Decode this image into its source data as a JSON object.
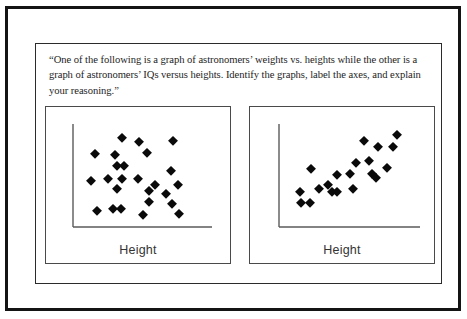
{
  "slide": {
    "background_color": "#ffffff",
    "frame_color": "#141414",
    "panel_border_color": "#2b2b2b",
    "prompt": "“One of the following is a graph of astronomers’ weights vs. heights while the other is a graph of astronomers’ IQs versus heights.  Identify the graphs, label the axes, and explain your reasoning.”"
  },
  "chart_data": [
    {
      "type": "scatter",
      "id": "left-scatter",
      "title": "",
      "xlabel": "Height",
      "ylabel": "",
      "xlim": [
        0,
        100
      ],
      "ylim": [
        0,
        100
      ],
      "grid": false,
      "legend": "none",
      "marker": "diamond",
      "marker_color": "#0a0a0a",
      "annotation": "No apparent correlation — random cloud of points",
      "points": [
        {
          "x": 9,
          "y": 70
        },
        {
          "x": 31,
          "y": 86
        },
        {
          "x": 25,
          "y": 68
        },
        {
          "x": 45,
          "y": 82
        },
        {
          "x": 73,
          "y": 83
        },
        {
          "x": 52,
          "y": 71
        },
        {
          "x": 27,
          "y": 57
        },
        {
          "x": 33,
          "y": 57
        },
        {
          "x": 71,
          "y": 52
        },
        {
          "x": 6,
          "y": 41
        },
        {
          "x": 20,
          "y": 43
        },
        {
          "x": 31,
          "y": 43
        },
        {
          "x": 44,
          "y": 43
        },
        {
          "x": 27,
          "y": 33
        },
        {
          "x": 53,
          "y": 31
        },
        {
          "x": 58,
          "y": 37
        },
        {
          "x": 77,
          "y": 37
        },
        {
          "x": 67,
          "y": 27
        },
        {
          "x": 53,
          "y": 19
        },
        {
          "x": 72,
          "y": 17
        },
        {
          "x": 11,
          "y": 10
        },
        {
          "x": 24,
          "y": 12
        },
        {
          "x": 30,
          "y": 12
        },
        {
          "x": 48,
          "y": 5
        },
        {
          "x": 78,
          "y": 6
        }
      ]
    },
    {
      "type": "scatter",
      "id": "right-scatter",
      "title": "",
      "xlabel": "Height",
      "ylabel": "",
      "xlim": [
        0,
        100
      ],
      "ylim": [
        0,
        100
      ],
      "grid": false,
      "legend": "none",
      "marker": "diamond",
      "marker_color": "#0a0a0a",
      "annotation": "Strong positive correlation — points rise left to right",
      "points": [
        {
          "x": 86,
          "y": 90
        },
        {
          "x": 60,
          "y": 83
        },
        {
          "x": 71,
          "y": 77
        },
        {
          "x": 83,
          "y": 77
        },
        {
          "x": 64,
          "y": 62
        },
        {
          "x": 53,
          "y": 60
        },
        {
          "x": 78,
          "y": 55
        },
        {
          "x": 17,
          "y": 54
        },
        {
          "x": 66,
          "y": 48
        },
        {
          "x": 48,
          "y": 48
        },
        {
          "x": 38,
          "y": 47
        },
        {
          "x": 69,
          "y": 44
        },
        {
          "x": 31,
          "y": 37
        },
        {
          "x": 51,
          "y": 33
        },
        {
          "x": 8,
          "y": 30
        },
        {
          "x": 23,
          "y": 33
        },
        {
          "x": 34,
          "y": 29
        },
        {
          "x": 38,
          "y": 30
        },
        {
          "x": 9,
          "y": 18
        },
        {
          "x": 16,
          "y": 18
        }
      ]
    }
  ],
  "charts": [
    {
      "name": "weights-vs-heights-or-iqs-left",
      "xlabel": "Height"
    },
    {
      "name": "weights-vs-heights-or-iqs-right",
      "xlabel": "Height"
    }
  ]
}
